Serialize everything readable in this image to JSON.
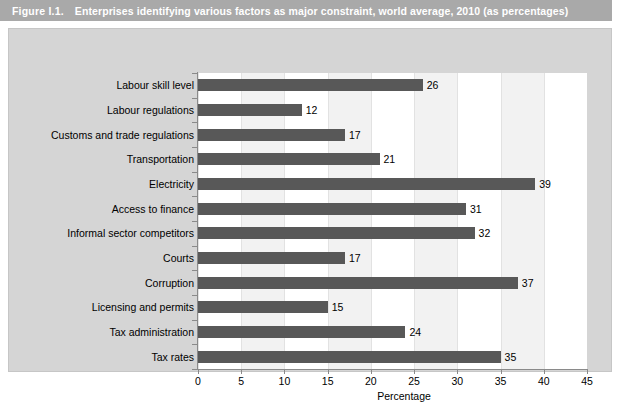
{
  "caption": {
    "figure_number": "Figure I.1.",
    "title": "Enterprises identifying various factors as major constraint, world average, 2010 (as percentages)"
  },
  "chart_data": {
    "type": "bar",
    "orientation": "horizontal",
    "title": "Enterprises identifying various factors as major constraint, world average, 2010 (as percentages)",
    "xlabel": "Percentage",
    "ylabel": "",
    "xlim": [
      0,
      45
    ],
    "xticks": [
      "0",
      "5",
      "10",
      "15",
      "20",
      "25",
      "30",
      "35",
      "40",
      "45"
    ],
    "grid": true,
    "legend": false,
    "bar_color": "#585858",
    "plot_background": "#f2f2f2",
    "band_color": "#ffffff",
    "panel_color": "#d5d5d5",
    "banner_color": "#a9a9a9",
    "categories": [
      "Labour skill level",
      "Labour regulations",
      "Customs and trade regulations",
      "Transportation",
      "Electricity",
      "Access to finance",
      "Informal sector competitors",
      "Courts",
      "Corruption",
      "Licensing and permits",
      "Tax administration",
      "Tax rates"
    ],
    "values": [
      26,
      12,
      17,
      21,
      39,
      31,
      32,
      17,
      37,
      15,
      24,
      35
    ],
    "value_labels": [
      "26",
      "12",
      "17",
      "21",
      "39",
      "31",
      "32",
      "17",
      "37",
      "15",
      "24",
      "35"
    ]
  }
}
